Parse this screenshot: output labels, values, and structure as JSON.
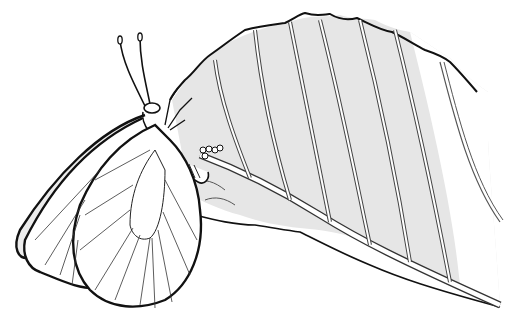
{
  "illustration": {
    "subject": "Butterfly laying eggs on underside of leaf",
    "style": "black line drawing with light gray shading",
    "colors": {
      "background": "#ffffff",
      "ink": "#111111",
      "leaf_shade": "#e4e4e4",
      "leaf_vein": "#ffffff"
    },
    "elements": [
      "leaf",
      "butterfly",
      "antennae",
      "wings",
      "eggs"
    ]
  }
}
